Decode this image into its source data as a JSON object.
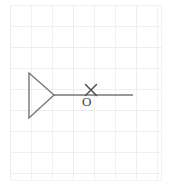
{
  "figure": {
    "background_color": "#ffffff",
    "grid": {
      "visible": true,
      "line_color": "#f0eff0",
      "major_line_color": "#eae9ea",
      "cell_size": 21,
      "origin_x": 10,
      "origin_y": 5,
      "columns": 7,
      "rows": 8,
      "area": {
        "x": 10,
        "y": 5,
        "width": 152,
        "height": 176
      }
    },
    "stroke_color": "#7d7d83",
    "dark_stroke_color": "#5b5b61",
    "stroke_width": 1.4,
    "shapes": [
      {
        "name": "triangle",
        "type": "polygon",
        "label": "right-pointing triangle",
        "points": [
          {
            "x": 29,
            "y": 73
          },
          {
            "x": 29,
            "y": 118
          },
          {
            "x": 54,
            "y": 95
          }
        ]
      },
      {
        "name": "ray",
        "type": "line",
        "label": "horizontal ray from triangle apex",
        "x1": 54,
        "y1": 95,
        "x2": 133,
        "y2": 95
      }
    ],
    "marks": [
      {
        "name": "cross-mark",
        "type": "x-mark",
        "symbol": "×",
        "center_x": 91,
        "center_y": 90,
        "size": 11
      }
    ],
    "labels": [
      {
        "name": "point-label-o",
        "text": "O",
        "x": 82,
        "y": 106,
        "font_size": 13,
        "color": "#3f3f45"
      }
    ]
  }
}
